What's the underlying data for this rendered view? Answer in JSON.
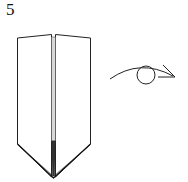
{
  "diagram": {
    "step_number": "5",
    "figure": "origami-model-front-view",
    "symbol": "turn-over-eye-arrow",
    "colors": {
      "line": "#222222",
      "paper": "#ffffff",
      "crease": "#888888"
    }
  }
}
